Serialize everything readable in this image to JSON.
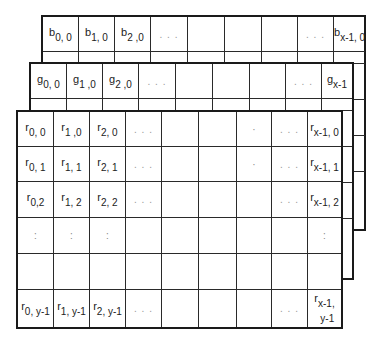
{
  "diagram": {
    "title": "",
    "planes": [
      {
        "name": "blue",
        "symbol": "b",
        "visible_row_labels": [
          [
            "b",
            "0, 0"
          ],
          [
            "b",
            "1, 0"
          ],
          [
            "b",
            "2 ,0"
          ],
          [
            "",
            "..."
          ],
          [
            "",
            ""
          ],
          [
            "",
            ""
          ],
          [
            "",
            ""
          ],
          [
            "",
            "..."
          ],
          [
            "b",
            "x-1, 0"
          ]
        ]
      },
      {
        "name": "green",
        "symbol": "g",
        "visible_row_labels": [
          [
            "g",
            "0, 0"
          ],
          [
            "g",
            "1 ,0"
          ],
          [
            "g",
            "2 ,0"
          ],
          [
            "",
            "..."
          ],
          [
            "",
            ""
          ],
          [
            "",
            ""
          ],
          [
            "",
            ""
          ],
          [
            "",
            "..."
          ],
          [
            "g",
            "x-1"
          ]
        ]
      },
      {
        "name": "red",
        "symbol": "r",
        "rows": [
          [
            [
              "r",
              "0, 0"
            ],
            [
              "r",
              "1 ,0"
            ],
            [
              "r",
              "2, 0"
            ],
            [
              "",
              "..."
            ],
            [
              "",
              ""
            ],
            [
              "",
              ""
            ],
            [
              "",
              "·"
            ],
            [
              "",
              "..."
            ],
            [
              "r",
              "x-1, 0"
            ]
          ],
          [
            [
              "r",
              "0, 1"
            ],
            [
              "r",
              "1, 1"
            ],
            [
              "r",
              "2, 1"
            ],
            [
              "",
              "..."
            ],
            [
              "",
              ""
            ],
            [
              "",
              ""
            ],
            [
              "",
              "·"
            ],
            [
              "",
              "..."
            ],
            [
              "r",
              "x-1, 1"
            ]
          ],
          [
            [
              "r",
              "0,2"
            ],
            [
              "r",
              "1, 2"
            ],
            [
              "r",
              "2, 2"
            ],
            [
              "",
              "..."
            ],
            [
              "",
              ""
            ],
            [
              "",
              ""
            ],
            [
              "",
              ""
            ],
            [
              "",
              "..."
            ],
            [
              "r",
              "x-1, 2"
            ]
          ],
          [
            [
              "",
              ":"
            ],
            [
              "",
              ":"
            ],
            [
              "",
              ":"
            ],
            [
              "",
              ""
            ],
            [
              "",
              ""
            ],
            [
              "",
              ""
            ],
            [
              "",
              ""
            ],
            [
              "",
              ""
            ],
            [
              "",
              ":"
            ]
          ],
          [
            [
              "",
              ""
            ],
            [
              "",
              ""
            ],
            [
              "",
              ""
            ],
            [
              "",
              ""
            ],
            [
              "",
              ""
            ],
            [
              "",
              ""
            ],
            [
              "",
              ""
            ],
            [
              "",
              ""
            ],
            [
              "",
              ""
            ]
          ],
          [
            [
              "r",
              "0, y-1"
            ],
            [
              "r",
              "1, y-1"
            ],
            [
              "r",
              "2, y-1"
            ],
            [
              "",
              "..."
            ],
            [
              "",
              ""
            ],
            [
              "",
              ""
            ],
            [
              "",
              ""
            ],
            [
              "",
              "..."
            ],
            [
              "r",
              "x-1,\ny-1"
            ]
          ]
        ]
      }
    ],
    "edge_glyphs": {
      "green_right_edge": [
        "",
        "2",
        "",
        ".",
        ""
      ],
      "blue_right_edge": [
        "",
        "",
        "",
        ".",
        ""
      ]
    }
  }
}
